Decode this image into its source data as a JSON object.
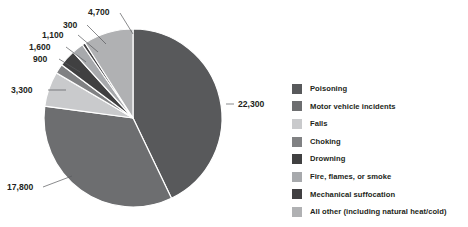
{
  "chart_data": {
    "type": "pie",
    "title": "",
    "total": 51700,
    "start_angle_deg": 0,
    "direction": "clockwise",
    "legend_position": "right",
    "grid": false,
    "categories": [
      "Poisoning",
      "Motor vehicle incidents",
      "Falls",
      "Choking",
      "Drowning",
      "Fire, flames, or smoke",
      "Mechanical suffocation",
      "All other (including natural heat/cold)"
    ],
    "values": [
      22300,
      17800,
      3300,
      900,
      1600,
      1100,
      300,
      4700
    ],
    "value_labels": [
      "22,300",
      "17,800",
      "3,300",
      "900",
      "1,600",
      "1,100",
      "300",
      "4,700"
    ],
    "colors": [
      "#58595b",
      "#6d6e70",
      "#c9cacc",
      "#808183",
      "#404041",
      "#a7a9ac",
      "#414042",
      "#b0b1b3"
    ]
  },
  "pie": {
    "center_x": 133,
    "center_y": 118,
    "radius": 89,
    "slice_stroke": "#ffffff",
    "slice_stroke_width": 1.2
  },
  "callouts": [
    {
      "text": "22,300",
      "x": 238,
      "y": 100,
      "leader": {
        "x1": 226,
        "y1": 104,
        "x2": 234,
        "y2": 104
      }
    },
    {
      "text": "17,800",
      "x": 7,
      "y": 183,
      "leader": {
        "x1": 43,
        "y1": 187,
        "x2": 72,
        "y2": 176
      }
    },
    {
      "text": "3,300",
      "x": 11,
      "y": 86,
      "leader": {
        "x1": 48,
        "y1": 90,
        "x2": 66,
        "y2": 90
      }
    },
    {
      "text": "900",
      "x": 33,
      "y": 55,
      "leader": {
        "x1": 59,
        "y1": 59,
        "x2": 80,
        "y2": 72
      }
    },
    {
      "text": "1,600",
      "x": 29,
      "y": 43,
      "leader": {
        "x1": 66,
        "y1": 47,
        "x2": 86,
        "y2": 62
      }
    },
    {
      "text": "1,100",
      "x": 42,
      "y": 31,
      "leader": {
        "x1": 78,
        "y1": 35,
        "x2": 98,
        "y2": 52
      }
    },
    {
      "text": "300",
      "x": 63,
      "y": 21,
      "leader": {
        "x1": 87,
        "y1": 25,
        "x2": 106,
        "y2": 44
      }
    },
    {
      "text": "4,700",
      "x": 88,
      "y": 8,
      "leader": {
        "x1": 120,
        "y1": 13,
        "x2": 133,
        "y2": 34
      }
    }
  ],
  "legend": {
    "items": [
      {
        "label": "Poisoning",
        "color": "#58595b"
      },
      {
        "label": "Motor vehicle incidents",
        "color": "#6d6e70"
      },
      {
        "label": "Falls",
        "color": "#c9cacc"
      },
      {
        "label": "Choking",
        "color": "#808183"
      },
      {
        "label": "Drowning",
        "color": "#404041"
      },
      {
        "label": "Fire, flames, or smoke",
        "color": "#a7a9ac"
      },
      {
        "label": "Mechanical suffocation",
        "color": "#414042"
      },
      {
        "label": "All other (including natural heat/cold)",
        "color": "#b0b1b3"
      }
    ]
  }
}
